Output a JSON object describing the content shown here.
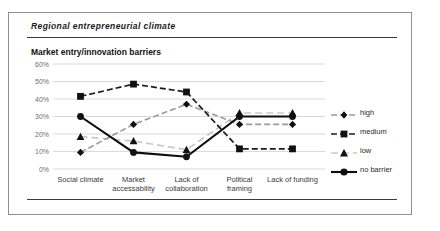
{
  "figure": {
    "title": "Regional  entrepreneurial  climate",
    "subtitle": "Market  entry/innovation barriers",
    "caption": ""
  },
  "chart_data": {
    "type": "line",
    "title": "Market  entry/innovation barriers",
    "xlabel": "",
    "ylabel": "",
    "ylim": [
      0,
      60
    ],
    "ytick_labels": [
      "0%",
      "10%",
      "20%",
      "30%",
      "40%",
      "50%",
      "60%"
    ],
    "ytick_values": [
      0,
      10,
      20,
      30,
      40,
      50,
      60
    ],
    "grid": true,
    "legend_position": "right",
    "categories": [
      "Social climate",
      "Market accessability",
      "Lack of collaboration",
      "Political framing",
      "Lack of funding"
    ],
    "category_lines": [
      [
        "Social climate"
      ],
      [
        "Market",
        "accessability"
      ],
      [
        "Lack of",
        "collaboration"
      ],
      [
        "Political",
        "framing"
      ],
      [
        "Lack of funding"
      ]
    ],
    "series": [
      {
        "name": "high",
        "marker": "diamond",
        "line": "dashed",
        "color": "#9a9a9a",
        "values": [
          9.5,
          25.5,
          37,
          25.5,
          25.5
        ]
      },
      {
        "name": "medium",
        "marker": "square",
        "line": "dashed",
        "color": "#1c1c1c",
        "values": [
          41.5,
          48.5,
          44,
          11.5,
          11.5
        ]
      },
      {
        "name": "low",
        "marker": "triangle",
        "line": "dashed",
        "color": "#c9c9c9",
        "values": [
          18.5,
          16,
          11,
          32,
          32
        ]
      },
      {
        "name": "no barrier",
        "marker": "circle",
        "line": "solid",
        "color": "#0d0d0d",
        "values": [
          30,
          9.5,
          7,
          30,
          30
        ]
      }
    ]
  },
  "legend": {
    "items": [
      {
        "label": "high"
      },
      {
        "label": "medium"
      },
      {
        "label": "low"
      },
      {
        "label": "no barrier"
      }
    ]
  }
}
